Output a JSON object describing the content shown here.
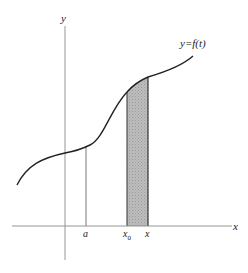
{
  "diagram": {
    "axes": {
      "x_label": "x",
      "y_label": "y"
    },
    "curve_label": "y=f(t)",
    "ticks": {
      "a": "a",
      "x0": "x",
      "x0_sub": "0",
      "x": "x"
    },
    "colors": {
      "axis": "#8a8a8a",
      "curve": "#222222",
      "shade": "#b8b8b8",
      "shade_edge": "#333333"
    }
  }
}
